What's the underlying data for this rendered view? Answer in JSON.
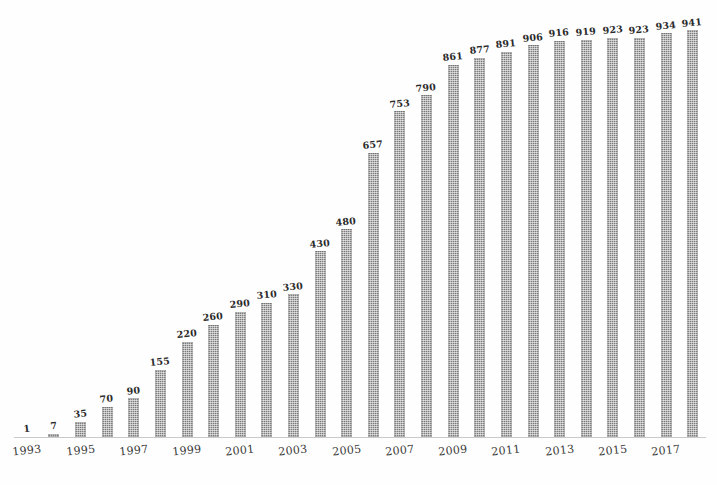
{
  "chart_data": {
    "type": "bar",
    "title": "",
    "subtitle": "",
    "xlabel": "",
    "ylabel": "",
    "grid": false,
    "legend": "none",
    "ylim": [
      0,
      941
    ],
    "categories": [
      "1993",
      "1994",
      "1995",
      "1996",
      "1997",
      "1998",
      "1999",
      "2000",
      "2001",
      "2002",
      "2003",
      "2004",
      "2005",
      "2006",
      "2007",
      "2008",
      "2009",
      "2010",
      "2011",
      "2012",
      "2013",
      "2014",
      "2015",
      "2016",
      "2017",
      "2018"
    ],
    "values": [
      1,
      7,
      35,
      70,
      90,
      155,
      220,
      260,
      290,
      310,
      330,
      430,
      480,
      657,
      753,
      790,
      861,
      877,
      891,
      906,
      916,
      919,
      923,
      923,
      934,
      941
    ],
    "value_labels": [
      "1",
      "7",
      "35",
      "70",
      "90",
      "155",
      "220",
      "260",
      "290",
      "310",
      "330",
      "430",
      "480",
      "657",
      "753",
      "790",
      "861",
      "877",
      "891",
      "906",
      "916",
      "919",
      "923",
      "923",
      "934",
      "941"
    ],
    "x_tick_labels": [
      "1993",
      "1995",
      "1997",
      "1999",
      "2001",
      "2003",
      "2005",
      "2007",
      "2009",
      "2011",
      "2013",
      "2015",
      "2017"
    ],
    "x_tick_indices": [
      0,
      2,
      4,
      6,
      8,
      10,
      12,
      14,
      16,
      18,
      20,
      22,
      24
    ],
    "colors": {
      "bar": "#7d7d7d",
      "label_text": "#2b2b2b",
      "axis_line": "#c9c9c9",
      "background": "#fefefe"
    }
  }
}
